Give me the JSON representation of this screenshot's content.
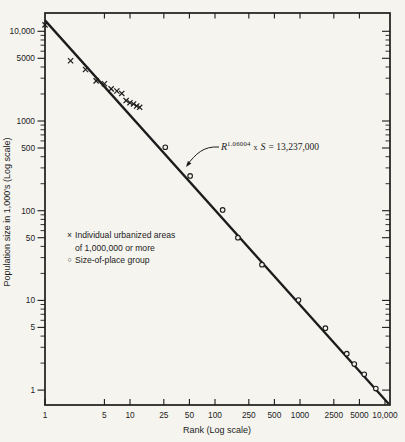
{
  "chart_data": {
    "type": "scatter",
    "title": "",
    "xlabel": "Rank (Log scale)",
    "ylabel": "Population size in 1,000's (Log scale)",
    "x_scale": "log",
    "y_scale": "log",
    "xlim": [
      1,
      11500
    ],
    "ylim": [
      0.68,
      16000
    ],
    "grid": false,
    "x_ticks": [
      {
        "v": 1,
        "label": "1"
      },
      {
        "v": 5,
        "label": "5"
      },
      {
        "v": 10,
        "label": "10"
      },
      {
        "v": 25,
        "label": "25"
      },
      {
        "v": 50,
        "label": "50"
      },
      {
        "v": 100,
        "label": "100"
      },
      {
        "v": 250,
        "label": "250"
      },
      {
        "v": 500,
        "label": "500"
      },
      {
        "v": 1000,
        "label": "1000"
      },
      {
        "v": 2500,
        "label": "2500"
      },
      {
        "v": 5000,
        "label": "5000"
      },
      {
        "v": 10000,
        "label": "10,000"
      }
    ],
    "x_top_ticks": [
      5,
      10,
      25,
      50,
      100,
      250,
      500,
      1000,
      2500,
      5000
    ],
    "y_ticks": [
      {
        "v": 10000,
        "label": "10,000"
      },
      {
        "v": 5000,
        "label": "5000"
      },
      {
        "v": 1000,
        "label": "1000"
      },
      {
        "v": 500,
        "label": "500"
      },
      {
        "v": 100,
        "label": "100"
      },
      {
        "v": 50,
        "label": "50"
      },
      {
        "v": 10,
        "label": "10"
      },
      {
        "v": 5,
        "label": "5"
      },
      {
        "v": 1,
        "label": "1"
      }
    ],
    "fit_line": {
      "equation_text": "R^1.06004 x S = 13,237,000",
      "value_at_rank_1_thousands": 13237,
      "slope_log_log": -1.06004
    },
    "series": [
      {
        "name": "Individual urbanized areas of 1,000,000 or more",
        "marker": "x",
        "points": [
          [
            1,
            11800
          ],
          [
            2,
            4700
          ],
          [
            3,
            3750
          ],
          [
            4,
            2800
          ],
          [
            5,
            2600
          ],
          [
            6,
            2280
          ],
          [
            7,
            2160
          ],
          [
            8,
            2030
          ],
          [
            9,
            1690
          ],
          [
            10,
            1600
          ],
          [
            11,
            1550
          ],
          [
            12,
            1470
          ],
          [
            13,
            1420
          ]
        ]
      },
      {
        "name": "Size-of-place group",
        "marker": "o",
        "points": [
          [
            26,
            510
          ],
          [
            51,
            244
          ],
          [
            123,
            102
          ],
          [
            186,
            50
          ],
          [
            357,
            25
          ],
          [
            960,
            10.1
          ],
          [
            1990,
            4.9
          ],
          [
            3550,
            2.55
          ],
          [
            4350,
            1.95
          ],
          [
            5700,
            1.5
          ],
          [
            7800,
            1.04
          ]
        ]
      }
    ],
    "annotation_arrow": {
      "from_xy": [
        219,
        147
      ],
      "to_xy": [
        186,
        167
      ]
    }
  },
  "equation": {
    "var1": "R",
    "exponent": "1.06004",
    "times": "x",
    "var2": "S",
    "rhs": "= 13,237,000"
  },
  "legend": {
    "marker_x": "×",
    "marker_o": "○",
    "item1_line1": "Individual urbanized areas",
    "item1_line2": "of 1,000,000 or more",
    "item2_label": "Size-of-place group"
  },
  "colors": {
    "ink": "#1c1c1c",
    "paper": "#f5f4ef"
  }
}
